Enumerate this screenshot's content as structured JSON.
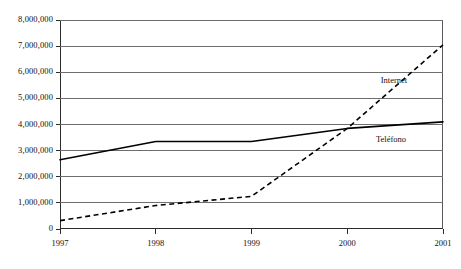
{
  "chart_data": {
    "type": "line",
    "title": "",
    "subtitle": "",
    "xlabel": "",
    "ylabel": "",
    "x": [
      1997,
      1998,
      1999,
      2000,
      2001
    ],
    "categories": [
      "1997",
      "1998",
      "1999",
      "2000",
      "2001"
    ],
    "xlim": [
      1997,
      2001
    ],
    "ylim": [
      0,
      8000000
    ],
    "grid": true,
    "legend_position": "inline-annotations",
    "series": [
      {
        "name": "Teléfono",
        "style": "solid",
        "color": "#000000",
        "values": [
          2650000,
          3350000,
          3350000,
          3850000,
          4100000
        ]
      },
      {
        "name": "Internet",
        "style": "dashed",
        "color": "#000000",
        "values": [
          320000,
          900000,
          1250000,
          3850000,
          7050000
        ]
      }
    ],
    "y_ticks": [
      {
        "value": 0,
        "label": "0"
      },
      {
        "value": 1000000,
        "label": "1,000,000"
      },
      {
        "value": 2000000,
        "label": "2,000,000"
      },
      {
        "value": 3000000,
        "label": "3,000,000"
      },
      {
        "value": 4000000,
        "label": "4,000,000"
      },
      {
        "value": 5000000,
        "label": "5,000,000"
      },
      {
        "value": 6000000,
        "label": "6,000,000"
      },
      {
        "value": 7000000,
        "label": "7,000,000"
      },
      {
        "value": 8000000,
        "label": "8,000,000"
      }
    ],
    "x_ticks": [
      {
        "value": 1997,
        "label": "1997"
      },
      {
        "value": 1998,
        "label": "1998"
      },
      {
        "value": 1999,
        "label": "1999"
      },
      {
        "value": 2000,
        "label": "2000"
      },
      {
        "value": 2001,
        "label": "2001"
      }
    ],
    "annotations": [
      {
        "text": "Internet",
        "x": 2000.35,
        "y": 5650000
      },
      {
        "text": "Teléfono",
        "x": 2000.3,
        "y": 3400000
      }
    ]
  }
}
